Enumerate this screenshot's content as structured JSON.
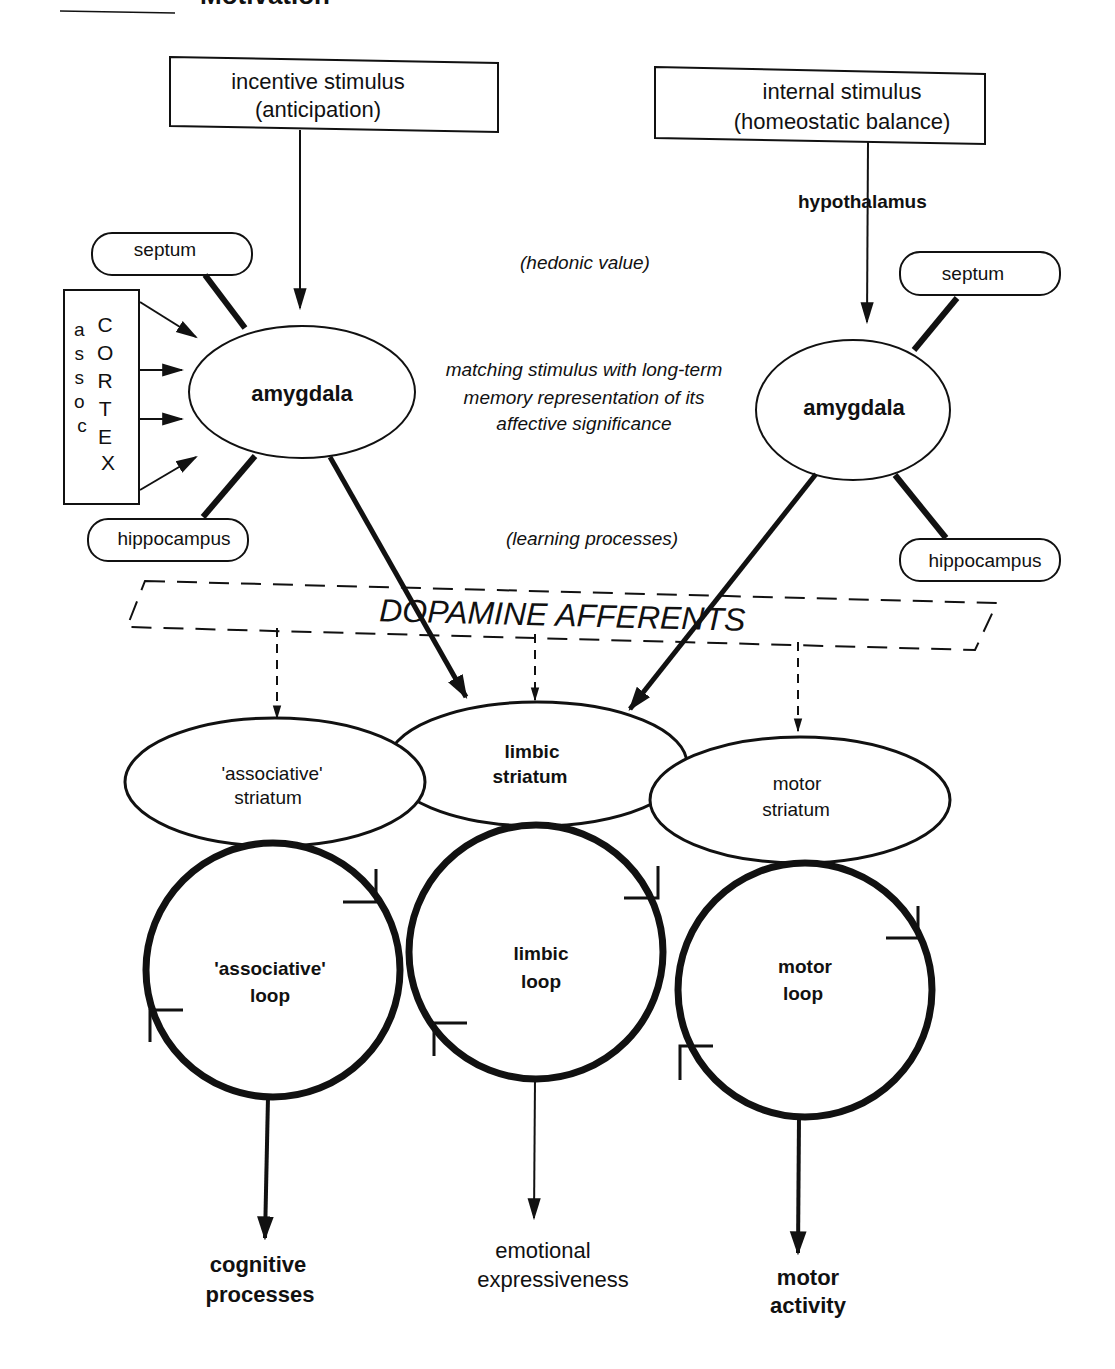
{
  "header": {
    "cropped_title_fragment": "Motivation"
  },
  "inputs": {
    "incentive": {
      "line1": "incentive stimulus",
      "line2": "(anticipation)"
    },
    "internal": {
      "line1": "internal stimulus",
      "line2": "(homeostatic balance)"
    },
    "hypothalamus_label": "hypothalamus"
  },
  "left_cluster": {
    "septum": "septum",
    "hippocampus": "hippocampus",
    "amygdala": "amygdala",
    "cortex": {
      "col1": [
        "a",
        "s",
        "s",
        "o",
        "c"
      ],
      "col2": [
        "C",
        "O",
        "R",
        "T",
        "E",
        "X"
      ]
    }
  },
  "right_cluster": {
    "septum": "septum",
    "hippocampus": "hippocampus",
    "amygdala": "amygdala"
  },
  "annotations": {
    "hedonic": "(hedonic value)",
    "matching": {
      "line1": "matching stimulus with long-term",
      "line2": "memory representation of its",
      "line3": "affective significance"
    },
    "learning": "(learning processes)"
  },
  "dopamine": {
    "label": "DOPAMINE AFFERENTS"
  },
  "striatum": {
    "associative": {
      "line1": "'associative'",
      "line2": "striatum"
    },
    "limbic": {
      "line1": "limbic",
      "line2": "striatum"
    },
    "motor": {
      "line1": "motor",
      "line2": "striatum"
    }
  },
  "loops": {
    "associative": {
      "line1": "'associative'",
      "line2": "loop"
    },
    "limbic": {
      "line1": "limbic",
      "line2": "loop"
    },
    "motor": {
      "line1": "motor",
      "line2": "loop"
    }
  },
  "outputs": {
    "cognitive": {
      "line1": "cognitive",
      "line2": "processes"
    },
    "emotional": {
      "line1": "emotional",
      "line2": "expressiveness"
    },
    "motor": {
      "line1": "motor",
      "line2": "activity"
    }
  },
  "colors": {
    "ink": "#111111",
    "background": "#ffffff"
  }
}
